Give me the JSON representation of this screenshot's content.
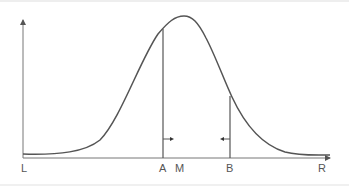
{
  "diagram": {
    "title": "",
    "type": "bell-curve-interval",
    "axis_labels": {
      "left": "L",
      "right": "R"
    },
    "markers": [
      {
        "id": "A",
        "label": "A",
        "arrow_direction": "right"
      },
      {
        "id": "M",
        "label": "M"
      },
      {
        "id": "B",
        "label": "B",
        "arrow_direction": "left"
      }
    ],
    "colors": {
      "curve": "#555555",
      "axis": "#666666",
      "label": "#555555"
    }
  }
}
